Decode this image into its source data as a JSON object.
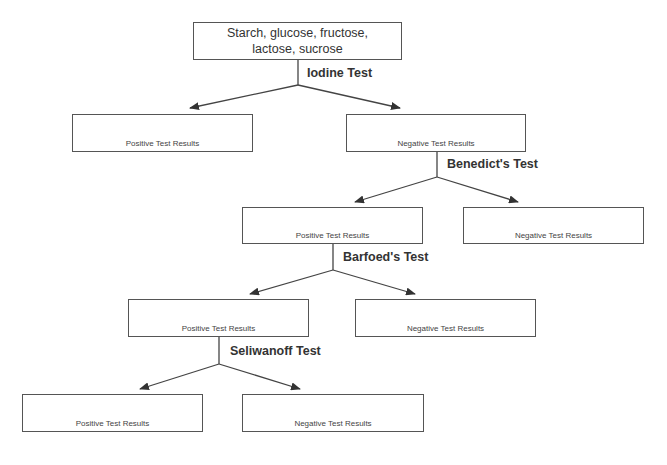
{
  "diagram": {
    "root": {
      "label": "Starch, glucose, fructose, lactose, sucrose"
    },
    "tests": [
      {
        "name": "Iodine Test"
      },
      {
        "name": "Benedict's Test"
      },
      {
        "name": "Barfoed's Test"
      },
      {
        "name": "Seliwanoff Test"
      }
    ],
    "results": {
      "iodine_positive": "Positive Test Results",
      "iodine_negative": "Negative Test Results",
      "benedict_positive": "Positive Test Results",
      "benedict_negative": "Negative Test Results",
      "barfoed_positive": "Positive Test Results",
      "barfoed_negative": "Negative Test Results",
      "seliwanoff_positive": "Positive Test Results",
      "seliwanoff_negative": "Negative Test Results"
    },
    "colors": {
      "line": "#444444",
      "box_border": "#555555",
      "text": "#333333"
    }
  }
}
